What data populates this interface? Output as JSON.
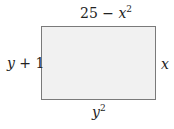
{
  "diagram": {
    "shape": "rectangle",
    "fill_color": "#f1f1f1",
    "border_color": "#7a7a7a",
    "labels": {
      "top": {
        "base": "25 − ",
        "var": "x",
        "exp": "2"
      },
      "left": {
        "var": "y",
        "rest": " + 1"
      },
      "right": {
        "var": "x"
      },
      "bottom": {
        "var": "y",
        "exp": "2"
      }
    }
  }
}
